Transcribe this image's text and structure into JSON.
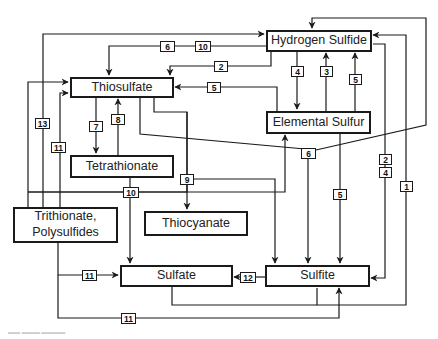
{
  "nodes": {
    "hydrogen_sulfide": "Hydrogen Sulfide",
    "thiosulfate": "Thiosulfate",
    "elemental_sulfur": "Elemental Sulfur",
    "tetrathionate": "Tetrathionate",
    "trithionate": "Trithionate,\nPolysulfides",
    "thiocyanate": "Thiocyanate",
    "sulfate": "Sulfate",
    "sulfite": "Sulfite"
  },
  "edge_labels": {
    "e6_top": "6",
    "e10_top": "10",
    "e2_top": "2",
    "e5_left": "5",
    "e4_mid": "4",
    "e3_mid": "3",
    "e5_right": "5",
    "e13": "13",
    "e11_left": "11",
    "e7": "7",
    "e8": "8",
    "e6_mid": "6",
    "e2_right": "2",
    "e4_right": "4",
    "e1": "1",
    "e9": "9",
    "e10_mid": "10",
    "e5_low": "5",
    "e11_sulfate": "11",
    "e12": "12",
    "e11_bottom": "11"
  }
}
